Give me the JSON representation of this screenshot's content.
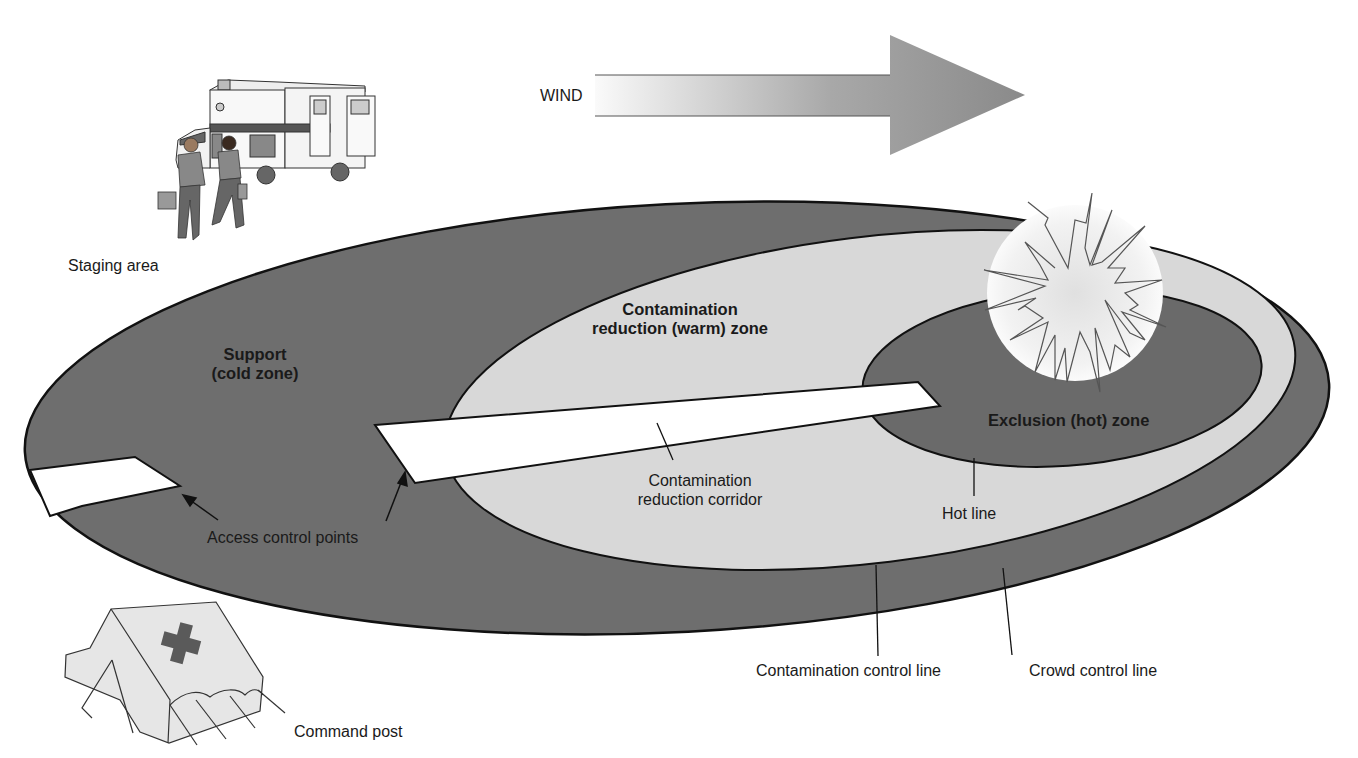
{
  "diagram": {
    "type": "hazmat-zone-layout",
    "colors": {
      "cold_zone": "#6e6e6e",
      "warm_zone": "#d8d8d8",
      "hot_zone": "#6a6a6a",
      "outline": "#111111",
      "corridor": "#ffffff",
      "explosion_fill": "#eeeeee",
      "wind_arrow_start": "#f4f4f4",
      "wind_arrow_end": "#8a8a8a"
    },
    "wind": {
      "label": "WIND",
      "direction": "right"
    },
    "zones": [
      {
        "id": "cold",
        "label_line1": "Support",
        "label_line2": "(cold zone)"
      },
      {
        "id": "warm",
        "label_line1": "Contamination",
        "label_line2": "reduction (warm) zone"
      },
      {
        "id": "hot",
        "label": "Exclusion (hot) zone"
      }
    ],
    "callouts": {
      "staging_area": "Staging area",
      "access_control_points": "Access control points",
      "corridor_line1": "Contamination",
      "corridor_line2": "reduction corridor",
      "hot_line": "Hot line",
      "contamination_control_line": "Contamination control line",
      "crowd_control_line": "Crowd control line",
      "command_post": "Command post"
    },
    "icons": [
      "ambulance-icon",
      "paramedics-icon",
      "explosion-icon",
      "command-tent-icon",
      "red-cross-icon"
    ]
  }
}
